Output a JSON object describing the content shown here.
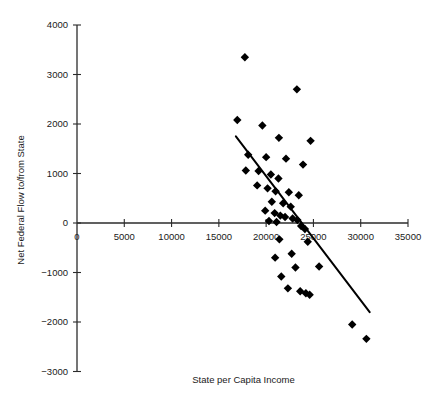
{
  "chart_data": {
    "type": "scatter",
    "title": "",
    "xlabel": "State per Capita Income",
    "ylabel": "Net Federal Flow to/from State",
    "xlim": [
      0,
      35000
    ],
    "ylim": [
      -3000,
      4000
    ],
    "xticks": [
      0,
      5000,
      10000,
      15000,
      20000,
      25000,
      30000,
      35000
    ],
    "yticks": [
      -3000,
      -2000,
      -1000,
      0,
      1000,
      2000,
      3000,
      4000
    ],
    "xtick_labels": [
      "0",
      "5000",
      "10000",
      "15000",
      "20000",
      "25000",
      "30000",
      "35000"
    ],
    "ytick_labels": [
      "-3000",
      "-2000",
      "-1000",
      "0",
      "1000",
      "2000",
      "3000",
      "4000"
    ],
    "grid": false,
    "legend": null,
    "marker": "diamond",
    "marker_color": "#000000",
    "points": [
      {
        "x": 17750,
        "y": 3350
      },
      {
        "x": 23250,
        "y": 2700
      },
      {
        "x": 16950,
        "y": 2080
      },
      {
        "x": 19600,
        "y": 1970
      },
      {
        "x": 21350,
        "y": 1720
      },
      {
        "x": 24700,
        "y": 1660
      },
      {
        "x": 18100,
        "y": 1380
      },
      {
        "x": 20000,
        "y": 1330
      },
      {
        "x": 22100,
        "y": 1300
      },
      {
        "x": 23900,
        "y": 1180
      },
      {
        "x": 17850,
        "y": 1060
      },
      {
        "x": 19200,
        "y": 1050
      },
      {
        "x": 20500,
        "y": 980
      },
      {
        "x": 21300,
        "y": 900
      },
      {
        "x": 19050,
        "y": 760
      },
      {
        "x": 20150,
        "y": 700
      },
      {
        "x": 21000,
        "y": 640
      },
      {
        "x": 22400,
        "y": 620
      },
      {
        "x": 23450,
        "y": 560
      },
      {
        "x": 20600,
        "y": 430
      },
      {
        "x": 21800,
        "y": 400
      },
      {
        "x": 22600,
        "y": 330
      },
      {
        "x": 19900,
        "y": 250
      },
      {
        "x": 20900,
        "y": 200
      },
      {
        "x": 21500,
        "y": 150
      },
      {
        "x": 22000,
        "y": 120
      },
      {
        "x": 22800,
        "y": 90
      },
      {
        "x": 23300,
        "y": 60
      },
      {
        "x": 20300,
        "y": 40
      },
      {
        "x": 21100,
        "y": 20
      },
      {
        "x": 23700,
        "y": -60
      },
      {
        "x": 24100,
        "y": -120
      },
      {
        "x": 21400,
        "y": -330
      },
      {
        "x": 24400,
        "y": -380
      },
      {
        "x": 22700,
        "y": -620
      },
      {
        "x": 20950,
        "y": -700
      },
      {
        "x": 23100,
        "y": -900
      },
      {
        "x": 25600,
        "y": -880
      },
      {
        "x": 21600,
        "y": -1080
      },
      {
        "x": 22300,
        "y": -1320
      },
      {
        "x": 23600,
        "y": -1380
      },
      {
        "x": 24200,
        "y": -1420
      },
      {
        "x": 24600,
        "y": -1450
      },
      {
        "x": 29100,
        "y": -2050
      },
      {
        "x": 30600,
        "y": -2340
      }
    ],
    "trend_line": {
      "x1": 16800,
      "y1": 1750,
      "x2": 30950,
      "y2": -1800
    }
  }
}
